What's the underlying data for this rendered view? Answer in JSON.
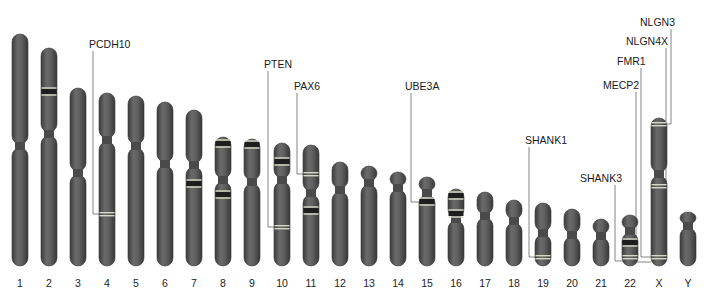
{
  "figure": {
    "title": ""
  },
  "colors": {
    "chromosome_body": "#5c5c5c",
    "chromosome_edge": "#3a3a3a",
    "dark_band": "#1e1e1e",
    "light_band": "#d8d8c8",
    "leader_line": "#666666",
    "background": "#ffffff"
  },
  "chromosomes": [
    {
      "id": "1",
      "label": "1",
      "x": 20,
      "top": 34,
      "cen": 146,
      "bottom": 266,
      "bands": []
    },
    {
      "id": "2",
      "label": "2",
      "x": 49,
      "top": 48,
      "cen": 134,
      "bottom": 266,
      "bands": [
        {
          "y": 92,
          "type": "dark"
        }
      ]
    },
    {
      "id": "3",
      "label": "3",
      "x": 78,
      "top": 88,
      "cen": 173,
      "bottom": 266,
      "bands": []
    },
    {
      "id": "4",
      "label": "4",
      "x": 107,
      "top": 93,
      "cen": 140,
      "bottom": 266,
      "bands": [
        {
          "y": 214,
          "type": "light"
        }
      ]
    },
    {
      "id": "5",
      "label": "5",
      "x": 136,
      "top": 96,
      "cen": 146,
      "bottom": 266,
      "bands": []
    },
    {
      "id": "6",
      "label": "6",
      "x": 165,
      "top": 102,
      "cen": 164,
      "bottom": 266,
      "bands": []
    },
    {
      "id": "7",
      "label": "7",
      "x": 194,
      "top": 110,
      "cen": 165,
      "bottom": 266,
      "bands": [
        {
          "y": 184,
          "type": "dark"
        }
      ]
    },
    {
      "id": "8",
      "label": "8",
      "x": 223,
      "top": 137,
      "cen": 180,
      "bottom": 266,
      "bands": [
        {
          "y": 144,
          "type": "dark"
        },
        {
          "y": 195,
          "type": "dark"
        }
      ]
    },
    {
      "id": "9",
      "label": "9",
      "x": 252,
      "top": 139,
      "cen": 182,
      "bottom": 266,
      "bands": [
        {
          "y": 145,
          "type": "dark"
        }
      ]
    },
    {
      "id": "10",
      "label": "10",
      "x": 282,
      "top": 143,
      "cen": 180,
      "bottom": 266,
      "bands": [
        {
          "y": 162,
          "type": "dark"
        },
        {
          "y": 227,
          "type": "light"
        }
      ]
    },
    {
      "id": "11",
      "label": "11",
      "x": 311,
      "top": 145,
      "cen": 193,
      "bottom": 266,
      "bands": [
        {
          "y": 174,
          "type": "light"
        },
        {
          "y": 211,
          "type": "dark"
        }
      ]
    },
    {
      "id": "12",
      "label": "12",
      "x": 340,
      "top": 162,
      "cen": 190,
      "bottom": 266,
      "bands": []
    },
    {
      "id": "13",
      "label": "13",
      "x": 369,
      "top": 166,
      "cen": 183,
      "bottom": 266,
      "bands": []
    },
    {
      "id": "14",
      "label": "14",
      "x": 398,
      "top": 172,
      "cen": 188,
      "bottom": 266,
      "bands": []
    },
    {
      "id": "15",
      "label": "15",
      "x": 427,
      "top": 177,
      "cen": 193,
      "bottom": 266,
      "bands": [
        {
          "y": 202,
          "type": "dark"
        }
      ]
    },
    {
      "id": "16",
      "label": "16",
      "x": 456,
      "top": 189,
      "cen": 219,
      "bottom": 266,
      "bands": [
        {
          "y": 196,
          "type": "dark"
        },
        {
          "y": 214,
          "type": "dark"
        }
      ]
    },
    {
      "id": "17",
      "label": "17",
      "x": 485,
      "top": 192,
      "cen": 216,
      "bottom": 266,
      "bands": []
    },
    {
      "id": "18",
      "label": "18",
      "x": 514,
      "top": 200,
      "cen": 221,
      "bottom": 266,
      "bands": []
    },
    {
      "id": "19",
      "label": "19",
      "x": 543,
      "top": 203,
      "cen": 233,
      "bottom": 266,
      "bands": [
        {
          "y": 257,
          "type": "light"
        }
      ]
    },
    {
      "id": "20",
      "label": "20",
      "x": 572,
      "top": 209,
      "cen": 235,
      "bottom": 266,
      "bands": []
    },
    {
      "id": "21",
      "label": "21",
      "x": 601,
      "top": 219,
      "cen": 236,
      "bottom": 266,
      "bands": []
    },
    {
      "id": "22",
      "label": "22",
      "x": 630,
      "top": 215,
      "cen": 231,
      "bottom": 266,
      "bands": [
        {
          "y": 243,
          "type": "dark"
        },
        {
          "y": 257,
          "type": "light"
        }
      ]
    },
    {
      "id": "X",
      "label": "X",
      "x": 659,
      "top": 118,
      "cen": 174,
      "bottom": 266,
      "bands": [
        {
          "y": 124,
          "type": "light"
        },
        {
          "y": 186,
          "type": "light"
        },
        {
          "y": 257,
          "type": "light"
        }
      ]
    },
    {
      "id": "Y",
      "label": "Y",
      "x": 688,
      "top": 212,
      "cen": 226,
      "bottom": 266,
      "bands": []
    }
  ],
  "genes": [
    {
      "name": "PCDH10",
      "chromosome": "4",
      "label_x": 89,
      "label_y": 38,
      "line_x": 93,
      "target_y": 214
    },
    {
      "name": "PTEN",
      "chromosome": "10",
      "label_x": 264,
      "label_y": 58,
      "line_x": 268,
      "target_y": 227
    },
    {
      "name": "PAX6",
      "chromosome": "11",
      "label_x": 294,
      "label_y": 80,
      "line_x": 297,
      "target_y": 174
    },
    {
      "name": "UBE3A",
      "chromosome": "15",
      "label_x": 405,
      "label_y": 80,
      "line_x": 411,
      "target_y": 202
    },
    {
      "name": "SHANK1",
      "chromosome": "19",
      "label_x": 525,
      "label_y": 134,
      "line_x": 529,
      "target_y": 257
    },
    {
      "name": "SHANK3",
      "chromosome": "22",
      "label_x": 580,
      "label_y": 172,
      "line_x": 615,
      "target_y": 261
    },
    {
      "name": "MECP2",
      "chromosome": "X",
      "label_x": 603,
      "label_y": 79,
      "line_x": 636,
      "target_y": 262
    },
    {
      "name": "FMR1",
      "chromosome": "X",
      "label_x": 617,
      "label_y": 55,
      "line_x": 641,
      "target_y": 257
    },
    {
      "name": "NLGN4X",
      "chromosome": "X",
      "label_x": 626,
      "label_y": 35,
      "line_x": 666,
      "target_y": 186
    },
    {
      "name": "NLGN3",
      "chromosome": "X",
      "label_x": 640,
      "label_y": 16,
      "line_x": 671,
      "target_y": 124
    }
  ]
}
